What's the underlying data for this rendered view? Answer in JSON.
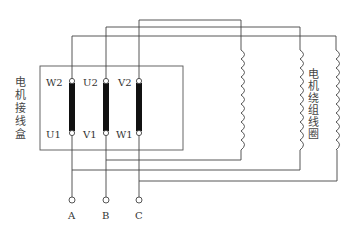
{
  "diagram": {
    "left_label": [
      "电",
      "机",
      "接",
      "线",
      "盒"
    ],
    "right_label": [
      "电",
      "机",
      "绕",
      "组",
      "线",
      "圈"
    ],
    "left_label_text": "电机接线盒",
    "right_label_text": "电机绕组线圈",
    "terminals_top": [
      "W2",
      "U2",
      "V2"
    ],
    "terminals_bottom": [
      "U1",
      "V1",
      "W1"
    ],
    "supply_terminals": [
      "A",
      "B",
      "C"
    ],
    "colors": {
      "line": "#444444",
      "link_bar": "#111111",
      "background": "#ffffff"
    }
  }
}
